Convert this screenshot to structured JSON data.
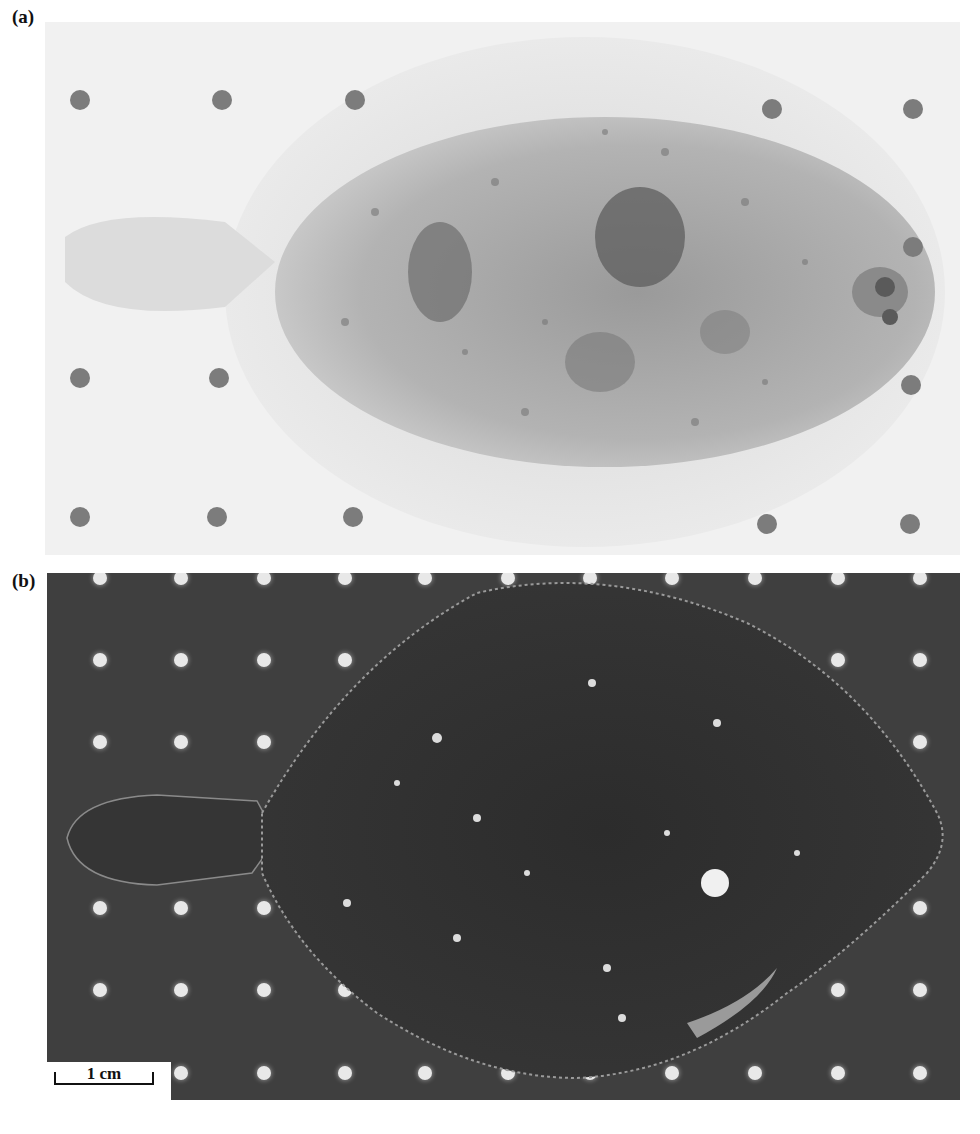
{
  "figure": {
    "panels": [
      {
        "label": "(a)",
        "description": "Flatfish on light background with dark dot grid",
        "background_color": "#f1f1f1",
        "dot_color": "#7c7c7c",
        "dots": [
          {
            "x": 35,
            "y": 78
          },
          {
            "x": 177,
            "y": 78
          },
          {
            "x": 310,
            "y": 78
          },
          {
            "x": 727,
            "y": 87
          },
          {
            "x": 868,
            "y": 87
          },
          {
            "x": 868,
            "y": 225
          },
          {
            "x": 35,
            "y": 356
          },
          {
            "x": 174,
            "y": 356
          },
          {
            "x": 866,
            "y": 363
          },
          {
            "x": 35,
            "y": 495
          },
          {
            "x": 172,
            "y": 495
          },
          {
            "x": 308,
            "y": 495
          },
          {
            "x": 722,
            "y": 502
          },
          {
            "x": 865,
            "y": 502
          }
        ]
      },
      {
        "label": "(b)",
        "description": "Same flatfish on dark background with white dot grid",
        "background_color": "#3f3f3f",
        "dot_color": "#e8e8e8",
        "dot_columns": [
          53,
          134,
          217,
          298,
          378,
          461,
          543,
          625,
          708,
          791,
          873
        ],
        "dot_rows": [
          5,
          87,
          169,
          252,
          335,
          417,
          500
        ]
      }
    ],
    "scale_bar": {
      "label": "1 cm"
    },
    "caption_partial": "(caption text cut off at bottom edge)"
  }
}
